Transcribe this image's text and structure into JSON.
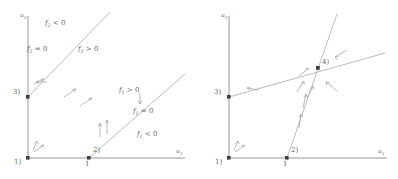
{
  "figure": {
    "type": "phase-plane-nullcline-diagram",
    "panel_count": 2,
    "stroke_color": "#9a9a9a",
    "axis_color": "#8c8c8c",
    "text_color": "#6a6a6a",
    "point_color": "#4a4a4a",
    "background": "#ffffff"
  },
  "axes": {
    "x_label": "u",
    "x_sub": "1",
    "y_label": "u",
    "y_sub": "2",
    "x_tick_label": "1"
  },
  "symbols": {
    "f1": "f",
    "f1_sub": "1",
    "f2": "f",
    "f2_sub": "2",
    "gt_zero": "> 0",
    "lt_zero": "< 0",
    "eq_zero": "= 0"
  },
  "left_panel": {
    "name": "left-panel",
    "region_labels": [
      {
        "id": "f2-neg",
        "fn": "f",
        "sub": "2",
        "op": "< 0"
      },
      {
        "id": "f2-zero",
        "fn": "f",
        "sub": "2",
        "op": "= 0"
      },
      {
        "id": "f2-pos",
        "fn": "f",
        "sub": "2",
        "op": "> 0"
      },
      {
        "id": "f1-pos",
        "fn": "f",
        "sub": "1",
        "op": "> 0"
      },
      {
        "id": "f1-zero",
        "fn": "f",
        "sub": "1",
        "op": "= 0"
      },
      {
        "id": "f1-neg",
        "fn": "f",
        "sub": "1",
        "op": "< 0"
      }
    ],
    "equilibria": [
      {
        "label": "1)",
        "x": 0,
        "y": 0
      },
      {
        "label": "2)",
        "x": 1,
        "y": 0
      },
      {
        "label": "3)",
        "x": 0,
        "y": 1
      }
    ],
    "x_tick": "1"
  },
  "right_panel": {
    "name": "right-panel",
    "equilibria": [
      {
        "label": "1)",
        "x": 0,
        "y": 0
      },
      {
        "label": "2)",
        "x": 1,
        "y": 0
      },
      {
        "label": "3)",
        "x": 0,
        "y": 1
      },
      {
        "label": "4)",
        "x": 1.55,
        "y": 1.55
      }
    ],
    "x_tick": "1"
  }
}
